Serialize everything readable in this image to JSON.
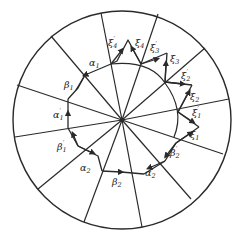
{
  "diagram": {
    "center": [
      122,
      120
    ],
    "radius": 109,
    "stroke_color": "#2a2a2a",
    "background": "#ffffff",
    "labels": {
      "alpha1": {
        "greek": "α",
        "sub": "1",
        "prime": ""
      },
      "beta1": {
        "greek": "β",
        "sub": "1",
        "prime": ""
      },
      "alpha1p": {
        "greek": "α",
        "sub": "1",
        "prime": "′"
      },
      "beta1p": {
        "greek": "β",
        "sub": "1",
        "prime": "′"
      },
      "alpha2": {
        "greek": "α",
        "sub": "2",
        "prime": ""
      },
      "beta2": {
        "greek": "β",
        "sub": "2",
        "prime": ""
      },
      "alpha2p": {
        "greek": "α",
        "sub": "2",
        "prime": "′"
      },
      "beta2p": {
        "greek": "β",
        "sub": "2",
        "prime": "′"
      },
      "xi1": {
        "greek": "ξ",
        "sub": "1",
        "prime": ""
      },
      "xi1p": {
        "greek": "ξ",
        "sub": "1",
        "prime": "′"
      },
      "xi2": {
        "greek": "ξ",
        "sub": "2",
        "prime": ""
      },
      "xi2p": {
        "greek": "ξ",
        "sub": "2",
        "prime": "′"
      },
      "xi3": {
        "greek": "ξ",
        "sub": "3",
        "prime": ""
      },
      "xi3p": {
        "greek": "ξ",
        "sub": "3",
        "prime": "′"
      },
      "xi4": {
        "greek": "ξ",
        "sub": "4",
        "prime": ""
      },
      "xi4p": {
        "greek": "ξ",
        "sub": "4",
        "prime": "′"
      }
    }
  }
}
